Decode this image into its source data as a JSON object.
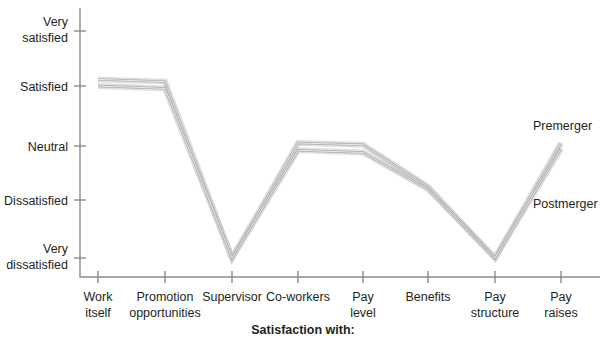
{
  "chart_data": {
    "type": "line",
    "title": "",
    "xlabel": "Satisfaction with:",
    "ylabel": "",
    "categories": [
      "Work itself",
      "Promotion opportunities",
      "Supervisor",
      "Co-workers",
      "Pay level",
      "Benefits",
      "Pay structure",
      "Pay raises"
    ],
    "category_lines": [
      [
        "Work",
        "itself"
      ],
      [
        "Promotion",
        "opportunities"
      ],
      [
        "Supervisor",
        ""
      ],
      [
        "Co-workers",
        ""
      ],
      [
        "Pay",
        "level"
      ],
      [
        "Benefits",
        ""
      ],
      [
        "Pay",
        "structure"
      ],
      [
        "Pay",
        "raises"
      ]
    ],
    "ytick_labels": [
      "Very satisfied",
      "Satisfied",
      "Neutral",
      "Dissatisfied",
      "Very dissatisfied"
    ],
    "ytick_label_lines": [
      [
        "Very",
        "satisfied"
      ],
      [
        "Satisfied",
        ""
      ],
      [
        "Neutral",
        ""
      ],
      [
        "Dissatisfied",
        ""
      ],
      [
        "Very",
        "dissatisfied"
      ]
    ],
    "ytick_values": [
      5,
      4,
      3,
      2,
      1
    ],
    "ylim": [
      0.75,
      5.35
    ],
    "grid": false,
    "legend_position": "inline-right",
    "series": [
      {
        "name": "Premerger",
        "color": "#a9a9a9",
        "values": [
          4.12,
          4.08,
          1.0,
          3.05,
          3.02,
          2.25,
          1.0,
          3.05
        ]
      },
      {
        "name": "Postmerger",
        "color": "#a9a9a9",
        "values": [
          4.0,
          3.96,
          1.0,
          2.92,
          2.88,
          2.2,
          1.0,
          2.95
        ]
      }
    ],
    "annotations": [
      {
        "text": "Premerger",
        "series": "Premerger",
        "x": 533,
        "y": 130
      },
      {
        "text": "Postmerger",
        "series": "Postmerger",
        "x": 533,
        "y": 208
      }
    ]
  },
  "axis": {
    "x_tick_pixels": [
      98,
      165,
      232,
      298,
      363,
      428,
      495,
      561
    ],
    "y_tick_pixels": [
      31,
      86,
      146,
      200,
      258
    ],
    "origin_x": 80,
    "baseline_y": 277,
    "top_y": 8
  }
}
